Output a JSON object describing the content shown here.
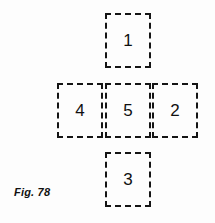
{
  "figure": {
    "caption": "Fig. 78",
    "background_color": "#fdfdfd",
    "border_color": "#151515",
    "text_color": "#101010",
    "layout": "plus-cross",
    "cell_width": 46,
    "cell_height": 55,
    "cells": [
      {
        "label": "1",
        "position": "top",
        "x": 105,
        "y": 13
      },
      {
        "label": "4",
        "position": "left",
        "x": 57,
        "y": 83
      },
      {
        "label": "5",
        "position": "center",
        "x": 105,
        "y": 83
      },
      {
        "label": "2",
        "position": "right",
        "x": 152,
        "y": 83
      },
      {
        "label": "3",
        "position": "bottom",
        "x": 105,
        "y": 152
      }
    ]
  }
}
